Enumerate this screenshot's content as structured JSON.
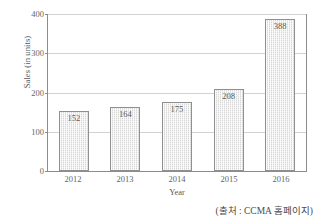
{
  "chart_data": {
    "type": "bar",
    "title": "",
    "categories": [
      "2012",
      "2013",
      "2014",
      "2015",
      "2016"
    ],
    "values": [
      152,
      164,
      175,
      208,
      388
    ],
    "xlabel": "Year",
    "ylabel": "Sales (in units)",
    "ylim": [
      0,
      400
    ],
    "yticks": [
      0,
      100,
      200,
      300,
      400
    ],
    "ytick_labels": [
      "0",
      "100",
      "200",
      "300",
      "400"
    ],
    "grid": true,
    "legend": false,
    "bar_color": "#d8d8d8",
    "bar_edge_color": "#909090",
    "grid_color": "#d2d2d2",
    "axis_color": "#8c8c8c",
    "text_color": "#595959",
    "data_labels": [
      "152",
      "164",
      "175",
      "208",
      "388"
    ],
    "data_label_position": "inside-top"
  },
  "caption": {
    "text": "(출처 : CCMA 홈페이지)"
  }
}
